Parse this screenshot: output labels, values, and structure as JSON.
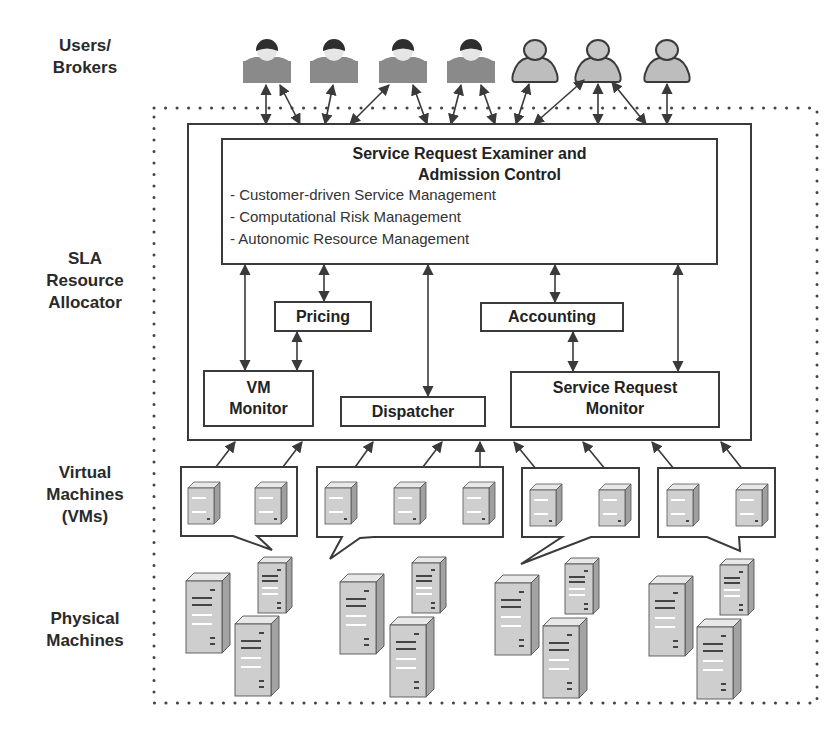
{
  "side_labels": {
    "users": [
      "Users/",
      "Brokers"
    ],
    "sla": [
      "SLA",
      "Resource",
      "Allocator"
    ],
    "vms": [
      "Virtual",
      "Machines",
      "(VMs)"
    ],
    "physical": [
      "Physical",
      "Machines"
    ]
  },
  "examiner": {
    "title_line1": "Service Request Examiner and",
    "title_line2": "Admission Control",
    "items": [
      "- Customer-driven Service Management",
      "- Computational Risk Management",
      "- Autonomic Resource Management"
    ]
  },
  "components": {
    "pricing": "Pricing",
    "accounting": "Accounting",
    "vm_monitor": [
      "VM",
      "Monitor"
    ],
    "dispatcher": "Dispatcher",
    "service_request_monitor": [
      "Service Request",
      "Monitor"
    ]
  },
  "users": {
    "type_a_count": 4,
    "type_b_count": 3
  },
  "vm_groups": [
    {
      "vm_count": 2
    },
    {
      "vm_count": 3
    },
    {
      "vm_count": 2
    },
    {
      "vm_count": 2
    }
  ],
  "physical_clusters": [
    {
      "server_count": 3
    },
    {
      "server_count": 3
    },
    {
      "server_count": 3
    },
    {
      "server_count": 3
    }
  ],
  "colors": {
    "line": "#3a3a3a",
    "user_body": "#8a8a8a",
    "user_hair": "#2e2e2e",
    "user_face": "#e6e6e6",
    "user_b_fill": "#bdbdbd",
    "server_front": "#cfcfcf",
    "server_side": "#a9a9a9",
    "server_top": "#e8e8e8"
  }
}
